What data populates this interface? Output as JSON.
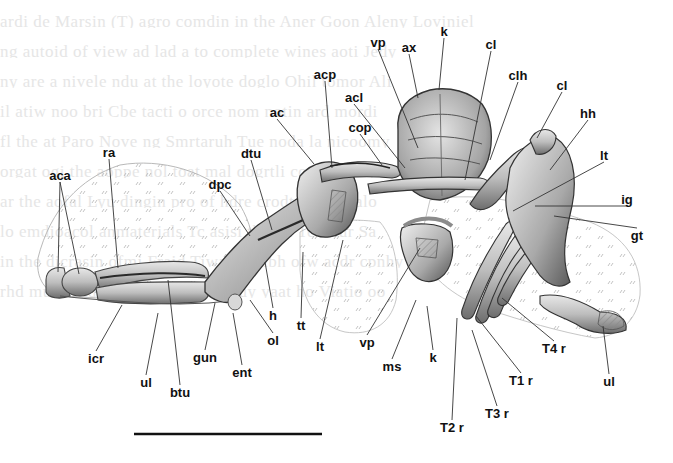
{
  "figure": {
    "type": "anatomical-illustration",
    "scale_bar": {
      "x1": 134,
      "x2": 322,
      "y": 434
    }
  },
  "labels": [
    {
      "id": "aca",
      "text": "aca",
      "x": 60,
      "y": 175,
      "lx": 58,
      "ly": 272
    },
    {
      "id": "aca-2",
      "text": "",
      "x": 60,
      "y": 175,
      "lx": 79,
      "ly": 274
    },
    {
      "id": "ra",
      "text": "ra",
      "x": 109,
      "y": 152,
      "lx": 118,
      "ly": 268
    },
    {
      "id": "acp",
      "text": "acp",
      "x": 325,
      "y": 74,
      "lx": 332,
      "ly": 168
    },
    {
      "id": "ac",
      "text": "ac",
      "x": 277,
      "y": 112,
      "lx": 314,
      "ly": 164
    },
    {
      "id": "dtu",
      "text": "dtu",
      "x": 251,
      "y": 153,
      "lx": 272,
      "ly": 230
    },
    {
      "id": "dpc",
      "text": "dpc",
      "x": 220,
      "y": 184,
      "lx": 250,
      "ly": 236
    },
    {
      "id": "vp-top",
      "text": "vp",
      "x": 378,
      "y": 42,
      "lx": 418,
      "ly": 148
    },
    {
      "id": "ax",
      "text": "ax",
      "x": 409,
      "y": 47,
      "lx": 418,
      "ly": 98
    },
    {
      "id": "k-top",
      "text": "k",
      "x": 444,
      "y": 31,
      "lx": 439,
      "ly": 90
    },
    {
      "id": "cl-top",
      "text": "cl",
      "x": 491,
      "y": 44,
      "lx": 465,
      "ly": 180
    },
    {
      "id": "clh",
      "text": "clh",
      "x": 518,
      "y": 75,
      "lx": 490,
      "ly": 160
    },
    {
      "id": "acl",
      "text": "acl",
      "x": 354,
      "y": 97,
      "lx": 405,
      "ly": 168
    },
    {
      "id": "cop",
      "text": "cop",
      "x": 360,
      "y": 127,
      "lx": 382,
      "ly": 165
    },
    {
      "id": "cl-right",
      "text": "cl",
      "x": 562,
      "y": 85,
      "lx": 537,
      "ly": 138
    },
    {
      "id": "hh",
      "text": "hh",
      "x": 588,
      "y": 113,
      "lx": 550,
      "ly": 170
    },
    {
      "id": "lt-right",
      "text": "lt",
      "x": 604,
      "y": 155,
      "lx": 513,
      "ly": 211
    },
    {
      "id": "ig",
      "text": "ig",
      "x": 627,
      "y": 199,
      "lx": 535,
      "ly": 206
    },
    {
      "id": "gt",
      "text": "gt",
      "x": 637,
      "y": 235,
      "lx": 554,
      "ly": 216
    },
    {
      "id": "icr",
      "text": "icr",
      "x": 96,
      "y": 358,
      "lx": 122,
      "ly": 305
    },
    {
      "id": "ul-left",
      "text": "ul",
      "x": 146,
      "y": 382,
      "lx": 158,
      "ly": 313
    },
    {
      "id": "btu",
      "text": "btu",
      "x": 180,
      "y": 392,
      "lx": 168,
      "ly": 280
    },
    {
      "id": "gun",
      "text": "gun",
      "x": 205,
      "y": 357,
      "lx": 215,
      "ly": 303
    },
    {
      "id": "ent",
      "text": "ent",
      "x": 242,
      "y": 372,
      "lx": 233,
      "ly": 313
    },
    {
      "id": "h",
      "text": "h",
      "x": 273,
      "y": 315,
      "lx": 265,
      "ly": 262
    },
    {
      "id": "ol",
      "text": "ol",
      "x": 273,
      "y": 340,
      "lx": 250,
      "ly": 300
    },
    {
      "id": "tt",
      "text": "tt",
      "x": 301,
      "y": 325,
      "lx": 303,
      "ly": 252
    },
    {
      "id": "lt-bottom",
      "text": "lt",
      "x": 320,
      "y": 346,
      "lx": 343,
      "ly": 240
    },
    {
      "id": "vp-bottom",
      "text": "vp",
      "x": 367,
      "y": 342,
      "lx": 420,
      "ly": 248
    },
    {
      "id": "ms",
      "text": "ms",
      "x": 392,
      "y": 366,
      "lx": 416,
      "ly": 300
    },
    {
      "id": "k-bottom",
      "text": "k",
      "x": 433,
      "y": 357,
      "lx": 427,
      "ly": 306
    },
    {
      "id": "t2r",
      "text": "T2 r",
      "x": 452,
      "y": 427,
      "lx": 457,
      "ly": 318
    },
    {
      "id": "t3r",
      "text": "T3 r",
      "x": 497,
      "y": 413,
      "lx": 472,
      "ly": 330
    },
    {
      "id": "t1r",
      "text": "T1 r",
      "x": 521,
      "y": 380,
      "lx": 476,
      "ly": 316
    },
    {
      "id": "t4r",
      "text": "T4 r",
      "x": 554,
      "y": 348,
      "lx": 502,
      "ly": 298
    },
    {
      "id": "ul-right",
      "text": "ul",
      "x": 609,
      "y": 381,
      "lx": 603,
      "ly": 326
    }
  ],
  "ghost_text_lines": [
    "ardi de Marsin  (T) agro  comdin in the Aner  Goon Aleny Loviniel",
    "ng  autoid  of  view ad  lad  a  to  complete  wines aoti  Jedy",
    "ny  are  a  nivele ndu  at  the  loyote  doglo  Ohil  tomor  Ali",
    "il  atiw  noo  bri   Cbe tacti  o  orce  nom  notin  ard mordi",
    "fl  the  at  Paro  Nove  ng  Smrtaruh   Tue  noda la  nicoomy",
    "orgat  ogi  the  aoppe  nol  toat  mal  dogrtli  cona  orionyd",
    "ar  the  aofal  Lyu  dingin  pro   of  hdre  crodtoaiot  tibalo",
    "lo  emdioacol  anmaterials   Tc  asisi  the  lat  Tei  mur  Sa",
    "in  the  dicrasin  ofmi  Fraid  Tiwagh  mibh  ofw  acdr  cpnhy",
    "rhd  mul  ilitidde  Edo  ore  etroo  ceuy  yaat  ho  Viatio  oo"
  ]
}
